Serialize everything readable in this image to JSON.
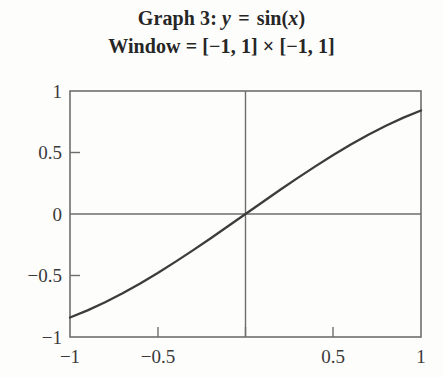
{
  "title": {
    "line1_prefix": "Graph 3:",
    "line1_y": "y",
    "line1_equals": "=",
    "line1_func": "sin(",
    "line1_x": "x",
    "line1_close": ")",
    "line2": "Window = [−1, 1] × [−1, 1]"
  },
  "colors": {
    "background": "#fdfdfc",
    "axis": "#6e6e6e",
    "frame": "#6e6e6e",
    "curve": "#3c3c3c",
    "text": "#2b2b2b"
  },
  "axes": {
    "x_ticks": [
      {
        "value": -1,
        "label": "−1"
      },
      {
        "value": -0.5,
        "label": "−0.5"
      },
      {
        "value": 0,
        "label": ""
      },
      {
        "value": 0.5,
        "label": "0.5"
      },
      {
        "value": 1,
        "label": "1"
      }
    ],
    "y_ticks": [
      {
        "value": 1,
        "label": "1"
      },
      {
        "value": 0.5,
        "label": "0.5"
      },
      {
        "value": 0,
        "label": "0"
      },
      {
        "value": -0.5,
        "label": "−0.5"
      },
      {
        "value": -1,
        "label": "−1"
      }
    ]
  },
  "chart_data": {
    "type": "line",
    "title": "Graph 3: y = sin(x)   Window = [−1, 1] × [−1, 1]",
    "subtitle": "Window = [−1, 1] × [−1, 1]",
    "xlabel": "",
    "ylabel": "",
    "xlim": [
      -1,
      1
    ],
    "ylim": [
      -1,
      1
    ],
    "xticks": [
      -1,
      -0.5,
      0,
      0.5,
      1
    ],
    "xticklabels": [
      "−1",
      "−0.5",
      "",
      "0.5",
      "1"
    ],
    "yticks": [
      -1,
      -0.5,
      0,
      0.5,
      1
    ],
    "yticklabels": [
      "−1",
      "−0.5",
      "0",
      "0.5",
      "1"
    ],
    "grid": false,
    "legend": false,
    "series": [
      {
        "name": "y = sin(x)",
        "function": "sin(x)",
        "x": [
          -1.0,
          -0.9,
          -0.8,
          -0.7,
          -0.6,
          -0.5,
          -0.4,
          -0.3,
          -0.2,
          -0.1,
          0.0,
          0.1,
          0.2,
          0.3,
          0.4,
          0.5,
          0.6,
          0.7,
          0.8,
          0.9,
          1.0
        ],
        "y": [
          -0.8415,
          -0.7833,
          -0.7174,
          -0.6442,
          -0.5646,
          -0.4794,
          -0.3894,
          -0.2955,
          -0.1987,
          -0.0998,
          0.0,
          0.0998,
          0.1987,
          0.2955,
          0.3894,
          0.4794,
          0.5646,
          0.6442,
          0.7174,
          0.7833,
          0.8415
        ]
      }
    ],
    "annotations": [
      {
        "text": "x-axis drawn at y = 0 across full window"
      },
      {
        "text": "y-axis drawn at x = 0 across full window"
      }
    ]
  }
}
